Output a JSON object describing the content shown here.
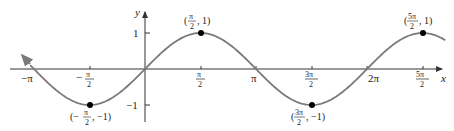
{
  "chart_data": {
    "type": "line",
    "xlabel": "x",
    "ylabel": "y",
    "function": "sin(x)",
    "x_range": [
      -3.45,
      8.5
    ],
    "ylim": [
      -1.3,
      1.3
    ],
    "grid": false,
    "legend": "none",
    "curve_color": "#7a7a7a",
    "x_ticks": [
      {
        "value": -3.14159,
        "label": "−π"
      },
      {
        "value": -1.5708,
        "label": "−π/2"
      },
      {
        "value": 1.5708,
        "label": "π/2"
      },
      {
        "value": 3.14159,
        "label": "π"
      },
      {
        "value": 4.71239,
        "label": "3π/2"
      },
      {
        "value": 6.28319,
        "label": "2π"
      },
      {
        "value": 7.85398,
        "label": "5π/2"
      }
    ],
    "y_ticks": [
      {
        "value": 1,
        "label": "1"
      },
      {
        "value": -1,
        "label": "−1"
      }
    ],
    "points": [
      {
        "x": -1.5708,
        "y": -1,
        "label": "(−π/2, −1)"
      },
      {
        "x": 1.5708,
        "y": 1,
        "label": "(π/2, 1)"
      },
      {
        "x": 4.71239,
        "y": -1,
        "label": "(3π/2, −1)"
      },
      {
        "x": 7.85398,
        "y": 1,
        "label": "(5π/2, 1)"
      }
    ]
  },
  "labels": {
    "x_axis": "x",
    "y_axis": "y",
    "neg_pi": "−π",
    "pi": "π",
    "two_pi": "2π",
    "one": "1",
    "neg_one": "−1"
  }
}
